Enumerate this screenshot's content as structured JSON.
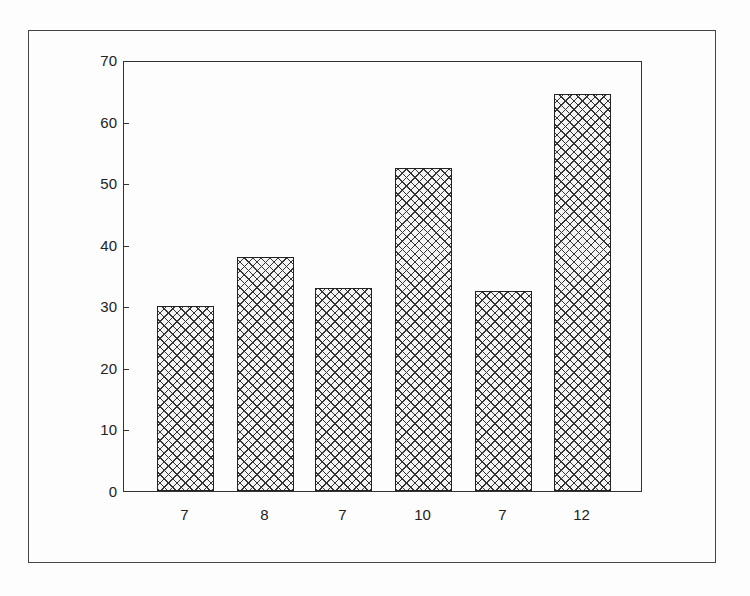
{
  "chart_data": {
    "type": "bar",
    "title": "",
    "xlabel": "",
    "ylabel": "",
    "categories": [
      "7",
      "8",
      "7",
      "10",
      "7",
      "12"
    ],
    "values": [
      30,
      38,
      33,
      52.4,
      32.5,
      64.4
    ],
    "ylim": [
      0,
      70
    ],
    "yticks": [
      0,
      10,
      20,
      30,
      40,
      50,
      60,
      70
    ],
    "grid": false,
    "legend": null,
    "bar_fill": "cross-hatch",
    "colors": {
      "bar_edge": "#222222",
      "hatch": "#333333",
      "background": "#fdfdfd"
    }
  }
}
